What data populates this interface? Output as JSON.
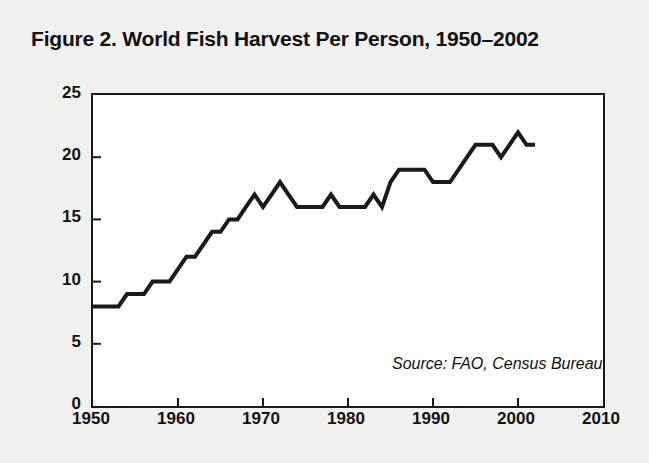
{
  "figure": {
    "title": "Figure 2. World Fish Harvest Per Person, 1950–2002",
    "source_note": "Source: FAO, Census Bureau",
    "background_color": "#f1f1ef",
    "plot_background_color": "#ffffff",
    "line_color": "#1a1a1a",
    "frame_color": "#1a1a1a"
  },
  "chart_data": {
    "type": "line",
    "title": "Figure 2. World Fish Harvest Per Person, 1950–2002",
    "xlabel": "",
    "ylabel": "Kilograms",
    "xlim": [
      1950,
      2010
    ],
    "ylim": [
      0,
      25
    ],
    "xticks": [
      1950,
      1960,
      1970,
      1980,
      1990,
      2000,
      2010
    ],
    "yticks": [
      0,
      5,
      10,
      15,
      20,
      25
    ],
    "xtick_labels": [
      "1950",
      "1960",
      "1970",
      "1980",
      "1990",
      "2000",
      "2010"
    ],
    "ytick_labels": [
      "0",
      "5",
      "10",
      "15",
      "20",
      "25"
    ],
    "grid": false,
    "legend": null,
    "annotations": [
      {
        "text": "Source: FAO, Census Bureau",
        "x": 1997,
        "y": 2.5,
        "style": "italic"
      }
    ],
    "x": [
      1950,
      1951,
      1952,
      1953,
      1954,
      1955,
      1956,
      1957,
      1958,
      1959,
      1960,
      1961,
      1962,
      1963,
      1964,
      1965,
      1966,
      1967,
      1968,
      1969,
      1970,
      1971,
      1972,
      1973,
      1974,
      1975,
      1976,
      1977,
      1978,
      1979,
      1980,
      1981,
      1982,
      1983,
      1984,
      1985,
      1986,
      1987,
      1988,
      1989,
      1990,
      1991,
      1992,
      1993,
      1994,
      1995,
      1996,
      1997,
      1998,
      1999,
      2000,
      2001,
      2002
    ],
    "values": [
      8,
      8,
      8,
      8,
      9,
      9,
      9,
      10,
      10,
      10,
      11,
      12,
      12,
      13,
      14,
      14,
      15,
      15,
      16,
      17,
      16,
      17,
      18,
      17,
      16,
      16,
      16,
      16,
      17,
      16,
      16,
      16,
      16,
      17,
      16,
      18,
      19,
      19,
      19,
      19,
      18,
      18,
      18,
      19,
      20,
      21,
      21,
      21,
      20,
      21,
      22,
      21,
      21
    ]
  },
  "axes": {
    "y_title": "Kilograms"
  }
}
